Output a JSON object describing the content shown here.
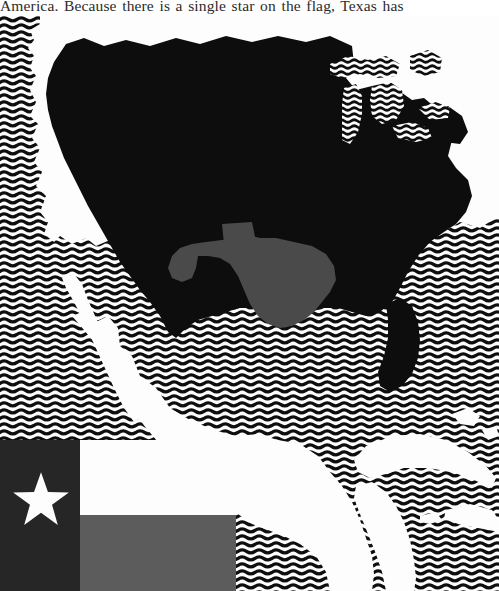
{
  "page": {
    "body_text_line": "America. Because there is a single star on the flag, Texas has"
  },
  "figure": {
    "name": "map-of-north-america-with-texas-highlighted",
    "caption": "",
    "colors": {
      "land_highlight_country": "#0d0d0d",
      "land_highlight_state": "#4a4a4a",
      "land_other": "#fdfdfd",
      "water_pattern_dark": "#111111",
      "water_pattern_light": "#fdfdfd",
      "page_background": "#ffffff"
    },
    "regions": [
      {
        "label": "United States",
        "fill": "country-highlight"
      },
      {
        "label": "Texas",
        "fill": "state-highlight"
      },
      {
        "label": "Canada",
        "fill": "land-plain"
      },
      {
        "label": "Mexico",
        "fill": "land-plain"
      },
      {
        "label": "Central America",
        "fill": "land-plain"
      },
      {
        "label": "Cuba",
        "fill": "land-plain"
      },
      {
        "label": "Hispaniola",
        "fill": "land-plain"
      },
      {
        "label": "Bahamas",
        "fill": "land-plain"
      },
      {
        "label": "Baja California",
        "fill": "land-plain"
      },
      {
        "label": "Pacific Ocean",
        "fill": "water-waves"
      },
      {
        "label": "Atlantic Ocean",
        "fill": "water-waves"
      },
      {
        "label": "Gulf of Mexico",
        "fill": "water-waves"
      },
      {
        "label": "Caribbean Sea",
        "fill": "water-waves"
      },
      {
        "label": "Great Lakes",
        "fill": "water-waves"
      },
      {
        "label": "Hudson Bay",
        "fill": "water-waves"
      }
    ]
  },
  "flag_inset": {
    "name": "texas-state-flag",
    "title": "Flag of Texas",
    "elements": [
      {
        "name": "hoist-band",
        "color": "#262626",
        "description": "vertical band at hoist"
      },
      {
        "name": "lone-star",
        "color": "#fdfdfd",
        "points": 5,
        "description": "single white five-pointed star"
      },
      {
        "name": "upper-stripe",
        "color": "#fdfdfd",
        "description": "white upper fly stripe"
      },
      {
        "name": "lower-stripe",
        "color": "#5c5c5c",
        "description": "gray (red) lower fly stripe"
      }
    ]
  }
}
